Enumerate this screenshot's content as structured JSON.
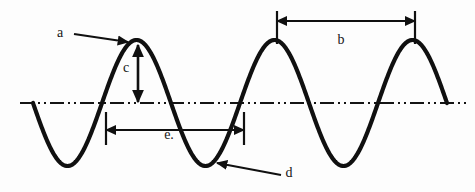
{
  "diagram": {
    "type": "wave-anatomy-diagram",
    "title": "",
    "background_color": "#fdfdfd",
    "wave": {
      "stroke_color": "#101010",
      "stroke_width": 4.2,
      "baseline_y": 103,
      "amplitude": 63,
      "wavelength": 138,
      "start_x": 33,
      "end_x": 447,
      "start_phase": "descending-from-zero",
      "crests_x": [
        138,
        277,
        415
      ],
      "crest_y": 40,
      "troughs_x": [
        70,
        208,
        346
      ],
      "trough_y": 167,
      "zero_crossings_x": [
        33,
        104,
        173,
        242,
        311,
        380,
        447
      ]
    },
    "centerline": {
      "name": "equilibrium-axis",
      "style": "dash-dot-dot",
      "color": "#141414",
      "y": 103,
      "x_start": 20,
      "x_end": 470,
      "stroke_width": 2.1
    },
    "labels": [
      {
        "id": "a",
        "text": "a",
        "x": 60,
        "y": 37,
        "annotation": "crest-pointer",
        "arrow": "horizontal-right"
      },
      {
        "id": "b",
        "text": "b",
        "x": 341,
        "y": 44,
        "annotation": "wavelength-crest-to-crest",
        "arrow": "double-headed-horizontal"
      },
      {
        "id": "c",
        "text": "c",
        "x": 126,
        "y": 72,
        "annotation": "amplitude",
        "arrow": "double-headed-vertical"
      },
      {
        "id": "d",
        "text": "d",
        "x": 289,
        "y": 177,
        "annotation": "trough-pointer",
        "arrow": "diagonal-up-left"
      },
      {
        "id": "e.",
        "text": "e.",
        "x": 169,
        "y": 139,
        "annotation": "wavelength-trough-span",
        "arrow": "double-headed-horizontal"
      }
    ],
    "leaders": {
      "a_arrow": {
        "x1": 74,
        "y1": 34,
        "x2": 128,
        "y2": 42
      },
      "c_arrow": {
        "x": 138,
        "y1": 45,
        "y2": 102
      },
      "b_arrow": {
        "x1": 277,
        "x2": 415,
        "y": 21
      },
      "b_tick_left": {
        "x": 277,
        "y1": 11,
        "y2": 44
      },
      "b_tick_right": {
        "x": 415,
        "y1": 11,
        "y2": 44
      },
      "e_arrow": {
        "x1": 106,
        "x2": 244,
        "y": 130
      },
      "e_tick_left": {
        "x": 106,
        "y1": 112,
        "y2": 145
      },
      "e_tick_right": {
        "x": 244,
        "y1": 112,
        "y2": 145
      },
      "d_arrow": {
        "x1": 281,
        "y1": 175,
        "x2": 217,
        "y2": 163
      }
    }
  }
}
